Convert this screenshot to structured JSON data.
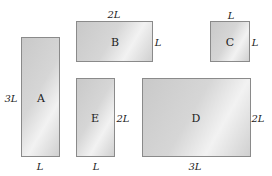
{
  "rectangles": [
    {
      "id": "A",
      "label": "A",
      "x": 21,
      "y": 37,
      "w": 39,
      "h": 120,
      "width_label": "L",
      "height_label": "3L"
    },
    {
      "id": "B",
      "label": "B",
      "x": 76,
      "y": 21,
      "w": 77,
      "h": 41,
      "width_label": "2L",
      "height_label": "L"
    },
    {
      "id": "C",
      "label": "C",
      "x": 210,
      "y": 21,
      "w": 40,
      "h": 41,
      "width_label": "L",
      "height_label": "L"
    },
    {
      "id": "E",
      "label": "E",
      "x": 76,
      "y": 78,
      "w": 39,
      "h": 79,
      "width_label": "L",
      "height_label": "2L"
    },
    {
      "id": "D",
      "label": "D",
      "x": 142,
      "y": 78,
      "w": 109,
      "h": 79,
      "width_label": "3L",
      "height_label": "2L"
    }
  ],
  "labels": {
    "A_name": "A",
    "B_name": "B",
    "C_name": "C",
    "D_name": "D",
    "E_name": "E",
    "A_height": "3L",
    "A_width": "L",
    "B_width": "2L",
    "B_height": "L",
    "C_width": "L",
    "C_height": "L",
    "E_width": "L",
    "E_height": "2L",
    "D_width": "3L",
    "D_height": "2L"
  }
}
